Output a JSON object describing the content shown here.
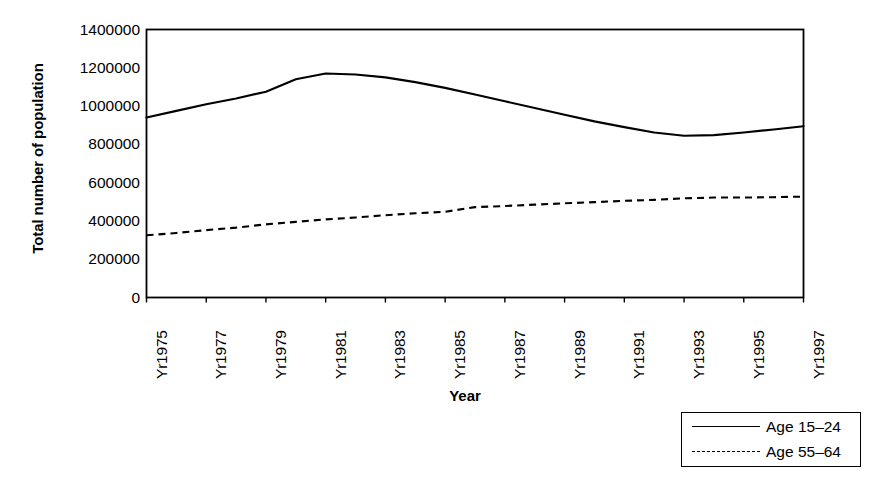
{
  "chart_data": {
    "type": "line",
    "title": "",
    "xlabel": "Year",
    "ylabel": "Total number of population",
    "ylim": [
      0,
      1400000
    ],
    "yticks": [
      0,
      200000,
      400000,
      600000,
      800000,
      1000000,
      1200000,
      1400000
    ],
    "ytick_labels": [
      "0",
      "200000",
      "400000",
      "600000",
      "800000",
      "1000000",
      "1200000",
      "1400000"
    ],
    "grid": false,
    "legend_position": "bottom-right",
    "x": [
      1975,
      1976,
      1977,
      1978,
      1979,
      1980,
      1981,
      1982,
      1983,
      1984,
      1985,
      1986,
      1987,
      1988,
      1989,
      1990,
      1991,
      1992,
      1993,
      1994,
      1995,
      1996,
      1997
    ],
    "x_tick_labels": [
      "Yr1975",
      "Yr1977",
      "Yr1979",
      "Yr1981",
      "Yr1983",
      "Yr1985",
      "Yr1987",
      "Yr1989",
      "Yr1991",
      "Yr1993",
      "Yr1995",
      "Yr1997"
    ],
    "x_tick_values": [
      1975,
      1977,
      1979,
      1981,
      1983,
      1985,
      1987,
      1989,
      1991,
      1993,
      1995,
      1997
    ],
    "series": [
      {
        "name": "Age 15-24",
        "label": "Age 15–24",
        "style": "solid",
        "color": "#000000",
        "values": [
          940000,
          975000,
          1010000,
          1040000,
          1075000,
          1140000,
          1170000,
          1165000,
          1150000,
          1125000,
          1095000,
          1060000,
          1025000,
          990000,
          955000,
          920000,
          890000,
          862000,
          845000,
          848000,
          862000,
          878000,
          895000
        ]
      },
      {
        "name": "Age 55-64",
        "label": "Age 55–64",
        "style": "dashed",
        "color": "#000000",
        "values": [
          325000,
          337000,
          352000,
          365000,
          382000,
          395000,
          408000,
          418000,
          430000,
          440000,
          448000,
          472000,
          478000,
          485000,
          492000,
          498000,
          505000,
          510000,
          518000,
          522000,
          522000,
          524000,
          527000
        ]
      }
    ]
  },
  "legend": {
    "items": [
      {
        "label": "Age 15–24",
        "style": "solid"
      },
      {
        "label": "Age 55–64",
        "style": "dashed"
      }
    ]
  }
}
